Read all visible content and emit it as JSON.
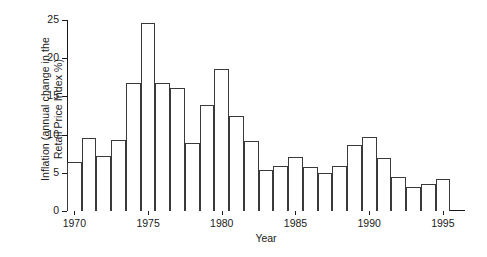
{
  "chart_data": {
    "type": "bar",
    "title": "",
    "xlabel": "Year",
    "ylabel": "Inflation (annual change in the Retail Price Index %)",
    "ylabel_line1": "Inflation (annual change in the",
    "ylabel_line2": "Retail Price Index %)",
    "categories": [
      1970,
      1971,
      1972,
      1973,
      1974,
      1975,
      1976,
      1977,
      1978,
      1979,
      1980,
      1981,
      1982,
      1983,
      1984,
      1985,
      1986,
      1987,
      1988,
      1989,
      1990,
      1991,
      1992,
      1993,
      1994,
      1995
    ],
    "values": [
      6.4,
      9.5,
      7.2,
      9.3,
      16.7,
      24.6,
      16.8,
      16.1,
      8.9,
      13.9,
      18.6,
      12.4,
      9.2,
      5.4,
      5.9,
      7.1,
      5.8,
      5.0,
      5.9,
      8.7,
      9.7,
      6.9,
      4.5,
      3.1,
      3.5,
      4.2
    ],
    "ylim": [
      0,
      25
    ],
    "yticks": [
      0,
      5,
      10,
      15,
      20,
      25
    ],
    "xticks": [
      1970,
      1975,
      1980,
      1985,
      1990,
      1995
    ],
    "xlim": [
      1969.5,
      1996.5
    ],
    "grid": false,
    "legend": false,
    "bar_fill_color": "#ffffff",
    "bar_edge_color": "#3a3a3a",
    "axis_color": "#1a1a1a"
  }
}
